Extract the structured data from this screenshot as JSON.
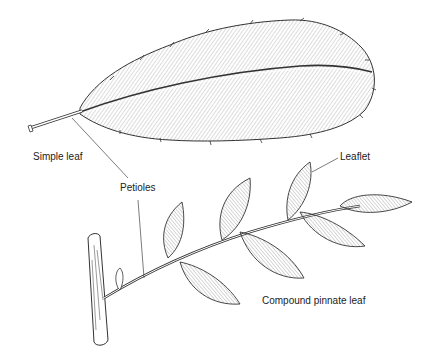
{
  "diagram": {
    "labels": {
      "simple_leaf": "Simple leaf",
      "petioles": "Petioles",
      "leaflet": "Leaflet",
      "compound_leaf": "Compound pinnate leaf"
    },
    "colors": {
      "ink": "#333333",
      "hatch": "#8a8a8a",
      "background": "#ffffff"
    }
  }
}
